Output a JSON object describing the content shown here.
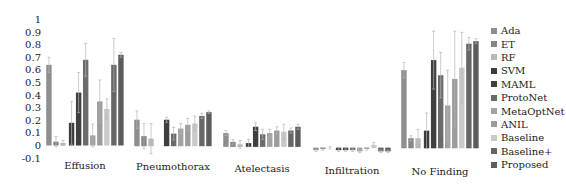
{
  "chart_data": {
    "type": "bar",
    "title": "",
    "xlabel": "",
    "ylabel": "",
    "ylim": [
      -0.1,
      1
    ],
    "yticks": [
      "1",
      "0.9",
      "0.8",
      "0.7",
      "0.6",
      "0.5",
      "0.4",
      "0.3",
      "0.2",
      "0.1",
      "0",
      "-0.1"
    ],
    "grid": false,
    "legend_position": "right",
    "error_bars": true,
    "categories": [
      "Effusion",
      "Pneumothorax",
      "Atelectasis",
      "Infiltration",
      "No Finding"
    ],
    "series": [
      {
        "name": "Ada",
        "color": "#8e8e8e",
        "values": [
          0.64,
          0.21,
          0.11,
          -0.02,
          0.62
        ],
        "errors": [
          0.06,
          0.07,
          0.02,
          0.01,
          0.06
        ]
      },
      {
        "name": "ET",
        "color": "#858585",
        "values": [
          0.03,
          0.08,
          0.04,
          -0.01,
          0.08
        ],
        "errors": [
          0.04,
          0.1,
          0.02,
          0.01,
          0.02
        ]
      },
      {
        "name": "RF",
        "color": "#b9b9b9",
        "values": [
          0.02,
          0.06,
          0.02,
          0.0,
          0.08
        ],
        "errors": [
          0.02,
          0.12,
          0.03,
          0.01,
          0.07
        ]
      },
      {
        "name": "SVM",
        "color": "#3c3c3c",
        "values": [
          0.18,
          0.0,
          0.03,
          -0.02,
          0.14
        ],
        "errors": [
          0.17,
          0.0,
          0.03,
          0.01,
          0.14
        ]
      },
      {
        "name": "MAML",
        "color": "#3f3f3f",
        "values": [
          0.42,
          0.21,
          0.16,
          -0.02,
          0.7
        ],
        "errors": [
          0.16,
          0.02,
          0.03,
          0.01,
          0.23
        ]
      },
      {
        "name": "ProtoNet",
        "color": "#6b6b6b",
        "values": [
          0.68,
          0.1,
          0.1,
          -0.02,
          0.58
        ],
        "errors": [
          0.13,
          0.05,
          0.04,
          0.01,
          0.18
        ]
      },
      {
        "name": "MetaOptNet",
        "color": "#a3a3a3",
        "values": [
          0.08,
          0.14,
          0.11,
          -0.03,
          0.34
        ],
        "errors": [
          0.09,
          0.04,
          0.03,
          0.01,
          0.28
        ]
      },
      {
        "name": "ANIL",
        "color": "#9c9c9c",
        "values": [
          0.35,
          0.17,
          0.13,
          -0.01,
          0.55
        ],
        "errors": [
          0.17,
          0.05,
          0.03,
          0.01,
          0.38
        ]
      },
      {
        "name": "Baseline",
        "color": "#c9c9c9",
        "values": [
          0.29,
          0.18,
          0.12,
          0.02,
          0.64
        ],
        "errors": [
          0.08,
          0.06,
          0.06,
          0.02,
          0.28
        ]
      },
      {
        "name": "Baseline+",
        "color": "#666666",
        "values": [
          0.64,
          0.24,
          0.13,
          -0.03,
          0.83
        ],
        "errors": [
          0.21,
          0.02,
          0.02,
          0.01,
          0.05
        ]
      },
      {
        "name": "Proposed",
        "color": "#5c5c5c",
        "values": [
          0.72,
          0.27,
          0.16,
          -0.03,
          0.85
        ],
        "errors": [
          0.02,
          0.01,
          0.02,
          0.01,
          0.02
        ]
      }
    ]
  }
}
